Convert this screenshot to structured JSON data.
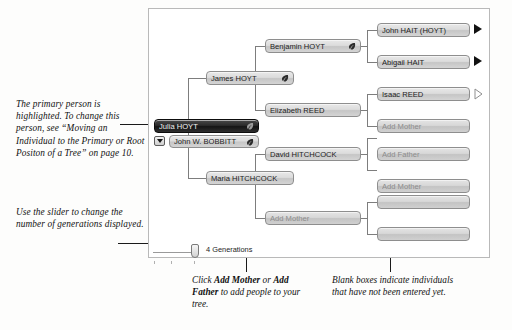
{
  "annotations": {
    "primary_person": "The primary person is highlighted. To change this person, see “Moving an Individual to the Primary or Root Positon of a Tree” on page 10.",
    "slider": "Use the slider to change the number of generations displayed."
  },
  "captions": {
    "add_people_pre": "Click ",
    "add_people_bold1": "Add Mother",
    "add_people_mid": " or ",
    "add_people_bold2": "Add Father",
    "add_people_post": " to add people to your tree.",
    "blank_boxes": "Blank boxes indicate individuals that have not been entered yet."
  },
  "tree": {
    "nodes": {
      "julia_hoyt": "Julia HOYT",
      "john_bobbitt": "John W. BOBBITT",
      "james_hoyt": "James HOYT",
      "maria_hitchcock": "Maria HITCHCOCK",
      "benjamin_hoyt": "Benjamin HOYT",
      "elizabeth_reed": "Elizabeth REED",
      "david_hitchcock": "David HITCHCOCK",
      "add_mother_hitchcock": "Add Mother",
      "john_hait": "John HAIT (HOYT)",
      "abigail_hait": "Abigail HAIT",
      "isaac_reed": "Isaac REED",
      "add_mother_reed": "Add Mother",
      "add_father_hitch": "Add Father",
      "add_mother_hitch": "Add Mother",
      "blank_1": "",
      "blank_2": ""
    },
    "icons": {
      "leaf": "leaf-hint-icon",
      "dropdown": "chevron-down-icon",
      "expand_filled": "expand-arrow-icon",
      "expand_hollow": "expand-arrow-outline-icon"
    }
  },
  "slider": {
    "label": "4 Generations",
    "value": 4
  },
  "colors": {
    "panel_border": "#b9b9b9",
    "node_border": "#8e8e8e",
    "primary_fill": "#151515",
    "empty_text": "#8c8c8c",
    "connector": "#7d7d7d"
  }
}
